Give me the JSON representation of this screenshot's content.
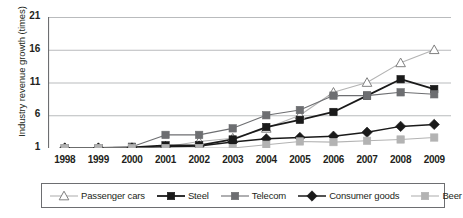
{
  "chart_data": {
    "type": "line",
    "title": "",
    "xlabel": "",
    "ylabel": "Industry revenue growth (times)",
    "categories": [
      "1998",
      "1999",
      "2000",
      "2001",
      "2002",
      "2003",
      "2004",
      "2005",
      "2006",
      "2007",
      "2008",
      "2009"
    ],
    "x": [
      1998,
      1999,
      2000,
      2001,
      2002,
      2003,
      2004,
      2005,
      2006,
      2007,
      2008,
      2009
    ],
    "ylim": [
      1,
      21
    ],
    "yticks": [
      1,
      6,
      11,
      16,
      21
    ],
    "ytick_labels": [
      "1",
      "6",
      "11",
      "16",
      "21"
    ],
    "grid": true,
    "grid_axis": "y",
    "legend_position": "bottom",
    "series": [
      {
        "name": "Passenger cars",
        "color": "#b3b3b3",
        "marker": "open-triangle",
        "marker_fill": "#ffffff",
        "marker_edge": "#808080",
        "line_width": 1.1,
        "values": [
          1,
          1,
          1,
          1.2,
          2,
          2.5,
          4,
          6,
          9.5,
          11,
          14,
          16
        ]
      },
      {
        "name": "Steel",
        "color": "#1a1a1a",
        "marker": "square",
        "marker_fill": "#1a1a1a",
        "marker_edge": "#1a1a1a",
        "line_width": 1.8,
        "values": [
          1,
          1,
          1.1,
          1.4,
          1.4,
          2.3,
          4.2,
          5.3,
          6.5,
          9,
          11.5,
          10
        ]
      },
      {
        "name": "Telecom",
        "color": "#6d6e71",
        "marker": "square",
        "marker_fill": "#6d6e71",
        "marker_edge": "#6d6e71",
        "line_width": 1.1,
        "values": [
          1,
          1,
          1.2,
          3,
          3,
          4,
          6,
          6.8,
          9,
          9,
          9.5,
          9.2
        ]
      },
      {
        "name": "Consumer goods",
        "color": "#1a1a1a",
        "marker": "diamond",
        "marker_fill": "#1a1a1a",
        "marker_edge": "#1a1a1a",
        "line_width": 1.5,
        "values": [
          1,
          1,
          1,
          1.2,
          1.3,
          1.9,
          2.4,
          2.6,
          2.8,
          3.4,
          4.3,
          4.6
        ]
      },
      {
        "name": "Beer",
        "color": "#b3b3b3",
        "marker": "square",
        "marker_fill": "#b3b3b3",
        "marker_edge": "#b3b3b3",
        "line_width": 1.1,
        "values": [
          1,
          1,
          1,
          1,
          1,
          1,
          1.5,
          2,
          1.9,
          2.1,
          2.3,
          2.6
        ]
      }
    ]
  },
  "colors": {
    "axis": "#6d6e71",
    "grid": "#a7a9ac",
    "text": "#231f20",
    "background": "#ffffff"
  }
}
